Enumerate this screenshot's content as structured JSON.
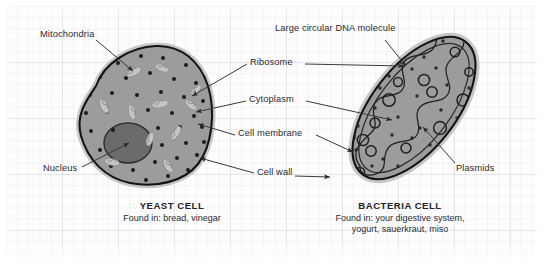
{
  "diagram": {
    "title_hidden": "",
    "background": {
      "kind": "graph-paper",
      "grid_color": "#8c96a5",
      "paper_color": "#fdfdfd"
    },
    "palette": {
      "cytoplasm": "#9c9c9c",
      "nucleus": "#6e6e6e",
      "outline": "#1a1a1a",
      "halo": "#c9c9c9",
      "organelle_light": "#c2c2c2",
      "ribosome": "#1d1d1d",
      "text": "#2b2b2f"
    },
    "labels": [
      {
        "id": "mitochondria",
        "text": "Mitochondria",
        "x": 40,
        "y": 30
      },
      {
        "id": "ribosome",
        "text": "Ribosome",
        "x": 250,
        "y": 63
      },
      {
        "id": "cytoplasm",
        "text": "Cytoplasm",
        "x": 249,
        "y": 100
      },
      {
        "id": "cell-membrane",
        "text": "Cell membrane",
        "x": 238,
        "y": 134
      },
      {
        "id": "cell-wall",
        "text": "Cell wall",
        "x": 257,
        "y": 172
      },
      {
        "id": "nucleus",
        "text": "Nucleus",
        "x": 43,
        "y": 168
      },
      {
        "id": "large-circular-dna",
        "text": "Large circular DNA molecule",
        "x": 275,
        "y": 28
      },
      {
        "id": "plasmids",
        "text": "Plasmids",
        "x": 456,
        "y": 168
      }
    ],
    "cells": [
      {
        "id": "yeast",
        "name": "YEAST CELL",
        "found_in": [
          "Found in: bread, vinegar"
        ],
        "caption_x": 92,
        "caption_y": 200,
        "caption_width": 160,
        "organelles": [
          "nucleus",
          "mitochondria",
          "ribosome",
          "cytoplasm",
          "cell membrane",
          "cell wall"
        ]
      },
      {
        "id": "bacteria",
        "name": "BACTERIA CELL",
        "found_in": [
          "Found in: your digestive system,",
          "yogurt, sauerkraut, miso"
        ],
        "caption_x": 300,
        "caption_y": 200,
        "caption_width": 200,
        "organelles": [
          "large circular DNA molecule",
          "plasmids",
          "ribosome",
          "cytoplasm",
          "cell membrane",
          "cell wall"
        ]
      }
    ]
  }
}
